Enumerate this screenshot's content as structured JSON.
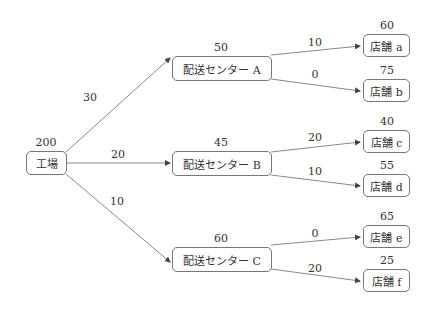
{
  "nodes": {
    "factory": {
      "label": "工場",
      "value": "200"
    },
    "centerA": {
      "label": "配送センター A",
      "value": "50"
    },
    "centerB": {
      "label": "配送センター B",
      "value": "45"
    },
    "centerC": {
      "label": "配送センター C",
      "value": "60"
    },
    "storeA": {
      "label": "店舗 a",
      "value": "60"
    },
    "storeB": {
      "label": "店舗 b",
      "value": "75"
    },
    "storeC": {
      "label": "店舗 c",
      "value": "40"
    },
    "storeD": {
      "label": "店舗 d",
      "value": "55"
    },
    "storeE": {
      "label": "店舗 e",
      "value": "65"
    },
    "storeF": {
      "label": "店舗 f",
      "value": "25"
    }
  },
  "edges": {
    "factory_A": "30",
    "factory_B": "20",
    "factory_C": "10",
    "A_a": "10",
    "A_b": "0",
    "B_c": "20",
    "B_d": "10",
    "C_e": "0",
    "C_f": "20"
  },
  "colors": {
    "line": "#777777",
    "text": "#333333",
    "border": "#777777"
  }
}
